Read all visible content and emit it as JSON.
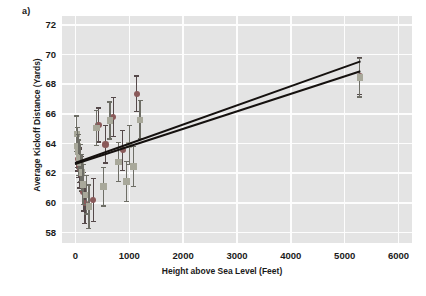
{
  "figure": {
    "panel_label": "a)",
    "background_color": "#ffffff"
  },
  "chart_data": {
    "type": "scatter",
    "title": "",
    "subtitle": "",
    "xlabel": "Height above Sea Level (Feet)",
    "ylabel": "Average Kickoff Distance (Yards)",
    "xlim": [
      -250,
      6250
    ],
    "ylim": [
      57.3,
      72.6
    ],
    "xticks": [
      0,
      1000,
      2000,
      3000,
      4000,
      5000,
      6000
    ],
    "yticks": [
      58,
      60,
      62,
      64,
      66,
      68,
      70,
      72
    ],
    "xtick_labels": [
      "0",
      "1000",
      "2000",
      "3000",
      "4000",
      "5000",
      "6000"
    ],
    "ytick_labels": [
      "58",
      "60",
      "62",
      "64",
      "66",
      "68",
      "70",
      "72"
    ],
    "grid": true,
    "grid_color": "#fdfdfd",
    "plot_background": "#e4e4e4",
    "legend": null,
    "legend_position": "none",
    "series": [
      {
        "name": "series-circles",
        "marker": "circle",
        "color": "#8a5a5a",
        "error_bar_color": "#55494a",
        "points": [
          {
            "x": 30,
            "y": 63.75,
            "yerr": 1.35
          },
          {
            "x": 45,
            "y": 63.35,
            "yerr": 1.2
          },
          {
            "x": 55,
            "y": 62.95,
            "yerr": 1.25
          },
          {
            "x": 70,
            "y": 62.55,
            "yerr": 1.15
          },
          {
            "x": 80,
            "y": 62.3,
            "yerr": 1.3
          },
          {
            "x": 110,
            "y": 61.95,
            "yerr": 1.2
          },
          {
            "x": 150,
            "y": 60.75,
            "yerr": 1.3
          },
          {
            "x": 175,
            "y": 60.0,
            "yerr": 1.4
          },
          {
            "x": 330,
            "y": 60.2,
            "yerr": 1.45
          },
          {
            "x": 430,
            "y": 65.25,
            "yerr": 1.15
          },
          {
            "x": 560,
            "y": 63.95,
            "yerr": 1.25
          },
          {
            "x": 700,
            "y": 65.8,
            "yerr": 1.3
          },
          {
            "x": 880,
            "y": 63.55,
            "yerr": 1.35
          },
          {
            "x": 1140,
            "y": 67.35,
            "yerr": 1.2
          },
          {
            "x": 5280,
            "y": 68.55,
            "yerr": 1.25
          }
        ]
      },
      {
        "name": "series-squares",
        "marker": "square",
        "color": "#a8a89a",
        "error_bar_color": "#6e6e66",
        "points": [
          {
            "x": 25,
            "y": 64.65,
            "yerr": 1.2
          },
          {
            "x": 40,
            "y": 63.85,
            "yerr": 1.25
          },
          {
            "x": 50,
            "y": 63.45,
            "yerr": 1.15
          },
          {
            "x": 65,
            "y": 63.05,
            "yerr": 1.2
          },
          {
            "x": 95,
            "y": 62.7,
            "yerr": 1.25
          },
          {
            "x": 120,
            "y": 62.05,
            "yerr": 1.2
          },
          {
            "x": 140,
            "y": 61.25,
            "yerr": 1.35
          },
          {
            "x": 200,
            "y": 60.55,
            "yerr": 1.3
          },
          {
            "x": 250,
            "y": 59.75,
            "yerr": 1.45
          },
          {
            "x": 390,
            "y": 65.05,
            "yerr": 1.2
          },
          {
            "x": 520,
            "y": 61.1,
            "yerr": 1.3
          },
          {
            "x": 640,
            "y": 65.55,
            "yerr": 1.25
          },
          {
            "x": 800,
            "y": 62.75,
            "yerr": 1.3
          },
          {
            "x": 950,
            "y": 61.45,
            "yerr": 1.35
          },
          {
            "x": 1000,
            "y": 63.9,
            "yerr": 1.3
          },
          {
            "x": 1080,
            "y": 62.45,
            "yerr": 1.35
          },
          {
            "x": 1200,
            "y": 65.6,
            "yerr": 1.3
          },
          {
            "x": 5280,
            "y": 68.45,
            "yerr": 1.3
          }
        ]
      }
    ],
    "trendlines": [
      {
        "name": "trendline-upper",
        "x0": 0,
        "y0": 62.75,
        "x1": 5300,
        "y1": 69.6,
        "color": "#15110f"
      },
      {
        "name": "trendline-lower",
        "x0": 0,
        "y0": 62.7,
        "x1": 5300,
        "y1": 68.95,
        "color": "#15110f"
      }
    ]
  }
}
